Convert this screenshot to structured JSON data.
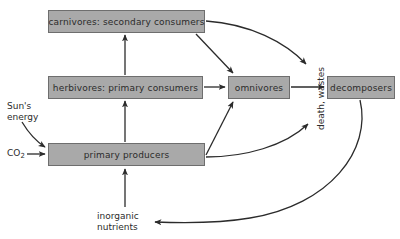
{
  "diagram": {
    "background_color": "#ffffff",
    "node_fill_color": "#a9a9a9",
    "node_border_color": "#6e6e6e",
    "edge_color": "#2b2b2b",
    "text_color": "#2b2b2b",
    "nodes": [
      {
        "id": "carnivores",
        "label": "carnivores: secondary consumers",
        "shape": "rectangle",
        "x": 48,
        "y": 10,
        "width": 157,
        "height": 23
      },
      {
        "id": "herbivores",
        "label": "herbivores: primary consumers",
        "shape": "rectangle",
        "x": 48,
        "y": 76,
        "width": 155,
        "height": 23
      },
      {
        "id": "omnivores",
        "label": "omnivores",
        "shape": "rectangle",
        "x": 228,
        "y": 76,
        "width": 62,
        "height": 23
      },
      {
        "id": "decomposers",
        "label": "decomposers",
        "shape": "rectangle",
        "x": 327,
        "y": 76,
        "width": 68,
        "height": 23
      },
      {
        "id": "primary_producers",
        "label": "primary producers",
        "shape": "rectangle",
        "x": 48,
        "y": 143,
        "width": 157,
        "height": 23
      }
    ],
    "free_labels": [
      {
        "id": "suns_energy",
        "text": "Sun's\nenergy",
        "x": 7,
        "y": 101
      },
      {
        "id": "co2",
        "text": "CO",
        "subscript": "2",
        "x": 7,
        "y": 148
      },
      {
        "id": "inorganic_nutrients",
        "text": "inorganic\nnutrients",
        "x": 97,
        "y": 211
      },
      {
        "id": "death_wastes",
        "text": "death, wastes",
        "rotation": -90,
        "x": 316,
        "y": 130
      }
    ],
    "edges": [
      {
        "id": "producers-to-herbivores",
        "from": "primary_producers",
        "to": "herbivores",
        "style": "straight-arrow"
      },
      {
        "id": "herbivores-to-carnivores",
        "from": "herbivores",
        "to": "carnivores",
        "style": "straight-arrow"
      },
      {
        "id": "herbivores-to-omnivores",
        "from": "herbivores",
        "to": "omnivores",
        "style": "straight-arrow"
      },
      {
        "id": "carnivores-to-omnivores",
        "from": "carnivores",
        "to": "omnivores",
        "style": "straight-arrow"
      },
      {
        "id": "producers-to-omnivores",
        "from": "primary_producers",
        "to": "omnivores",
        "style": "straight-arrow"
      },
      {
        "id": "omnivores-to-decomposers",
        "from": "omnivores",
        "to": "decomposers",
        "style": "straight-arrow"
      },
      {
        "id": "carnivores-to-death-wastes",
        "from": "carnivores",
        "to": "death_wastes",
        "style": "curved-arrow"
      },
      {
        "id": "producers-to-death-wastes",
        "from": "primary_producers",
        "to": "death_wastes",
        "style": "curved-arrow"
      },
      {
        "id": "decomposers-to-inorganic-nutrients",
        "from": "decomposers",
        "to": "inorganic_nutrients",
        "style": "curved-arrow"
      },
      {
        "id": "inorganic-nutrients-to-producers",
        "from": "inorganic_nutrients",
        "to": "primary_producers",
        "style": "straight-arrow"
      },
      {
        "id": "suns-energy-to-producers",
        "from": "suns_energy",
        "to": "primary_producers",
        "style": "curved-arrow"
      },
      {
        "id": "co2-to-producers",
        "from": "co2",
        "to": "primary_producers",
        "style": "straight-arrow"
      }
    ]
  }
}
